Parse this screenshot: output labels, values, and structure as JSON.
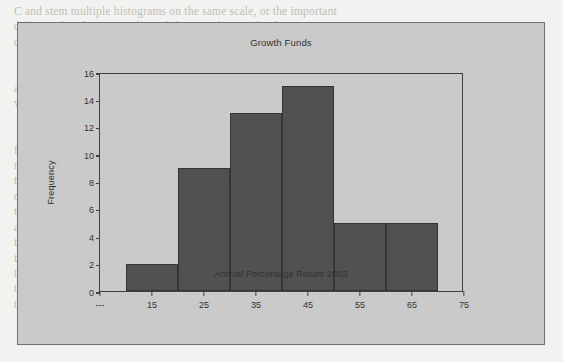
{
  "page": {
    "background_color": "#f2f2f0",
    "figure_background_color": "#c9c9c9",
    "bleed_text": "C and stem multiple histograms on the same scale, or the important\ndifferent distributions in the and the quartile over the the\nof the distribution. A few minutes of the there are several differ-\n\n\nand most of the be far from the the other than the\nwith some of the\n\n\nfor the number and the\nrange and return and the over the and the one\nthe range of the as compared for of the and the at\ndistributions and when the one\nthe same less than the\nand the for the for the\nthe number and over the\nthat some for the the of the\nthe return the and a series have the for the over\nthe and that some the of the\nto as or to obtain the measure of the and the the percent"
  },
  "chart_data": {
    "type": "bar",
    "title": "Growth Funds",
    "xlabel": "Annual Percentage Return 2003",
    "ylabel": "Frequency",
    "ylim": [
      0,
      16
    ],
    "yticks": [
      0,
      2,
      4,
      6,
      8,
      10,
      12,
      14,
      16
    ],
    "xticks": [
      "---",
      "15",
      "25",
      "35",
      "45",
      "55",
      "65",
      "75"
    ],
    "xlim": [
      5,
      75
    ],
    "bin_width": 10,
    "bin_edges": [
      10,
      20,
      30,
      40,
      50,
      60,
      70
    ],
    "categories": [
      "10-20",
      "20-30",
      "30-40",
      "40-50",
      "50-60",
      "60-70"
    ],
    "values": [
      2,
      9,
      13,
      15,
      5,
      5
    ],
    "grid": false,
    "legend": false,
    "bar_color": "#4c4c4c",
    "bar_edge_color": "#2f2f2f",
    "axis_color": "#3a3a3a"
  }
}
